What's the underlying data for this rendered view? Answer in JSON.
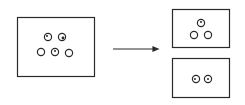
{
  "diagram": {
    "source_box": {
      "cell_count": 5
    },
    "arrow": {
      "direction": "right"
    },
    "result_boxes": [
      {
        "cell_count": 3
      },
      {
        "cell_count": 2
      }
    ],
    "colors": {
      "stroke": "#2a2a2a",
      "background": "#ffffff"
    }
  }
}
